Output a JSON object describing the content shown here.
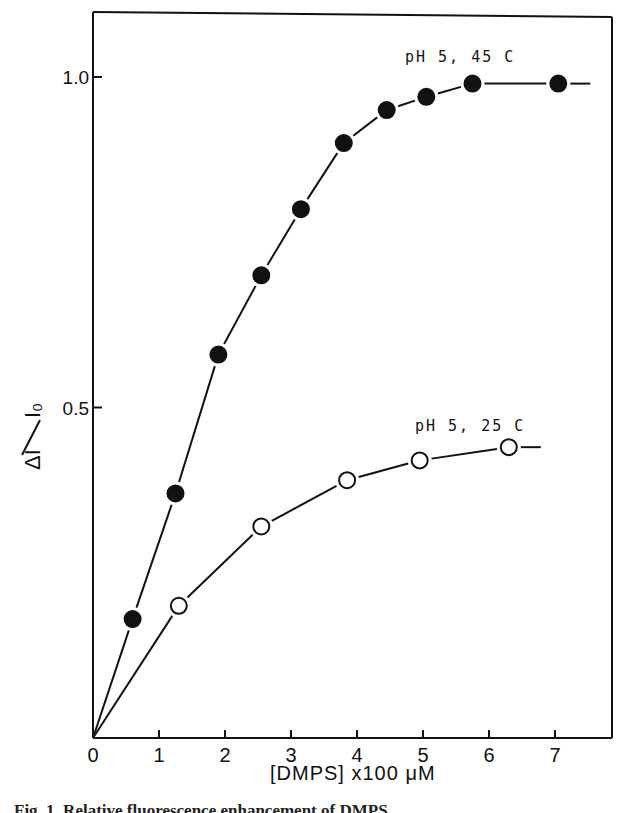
{
  "chart_data": {
    "type": "line",
    "title": "",
    "xlabel": "[DMPS]  x100 μM",
    "ylabel": "ΔI / I₀",
    "xlim": [
      0,
      7.8
    ],
    "ylim": [
      0,
      1.1
    ],
    "x_ticks": [
      0,
      1,
      2,
      3,
      4,
      5,
      6,
      7
    ],
    "x_tick_labels": [
      "0",
      "1",
      "2",
      "3",
      "4",
      "5",
      "6",
      "7"
    ],
    "y_ticks": [
      0.5,
      1.0
    ],
    "y_tick_labels": [
      "0.5",
      "1.0"
    ],
    "grid": false,
    "legend": "inline curve labels",
    "series": [
      {
        "name": "pH 5, 45 C",
        "marker": "filled-circle",
        "x": [
          0,
          0.6,
          1.25,
          1.9,
          2.55,
          3.15,
          3.8,
          4.45,
          5.05,
          5.75,
          7.05
        ],
        "y": [
          0,
          0.18,
          0.37,
          0.58,
          0.7,
          0.8,
          0.9,
          0.95,
          0.97,
          0.99,
          0.99
        ]
      },
      {
        "name": "pH 5, 25 C",
        "marker": "open-circle",
        "x": [
          0,
          1.3,
          2.55,
          3.85,
          4.95,
          6.3
        ],
        "y": [
          0,
          0.2,
          0.32,
          0.39,
          0.42,
          0.44
        ]
      }
    ],
    "annotations": [
      "pH 5, 45 C",
      "pH 5, 25 C"
    ]
  },
  "labels": {
    "x_axis": "[DMPS]  x100 μM",
    "y_axis_num": "ΔI",
    "y_axis_den": "I₀",
    "series1_label": "pH 5,  45 C",
    "series2_label": "pH 5,  25 C",
    "caption": "Fig. 1. Relative fluorescence enhancement of DMPS ..."
  }
}
